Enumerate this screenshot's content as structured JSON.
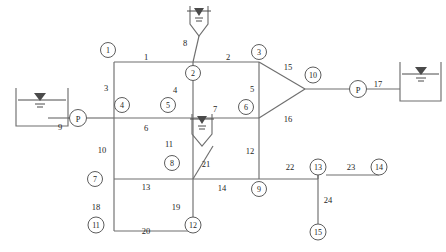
{
  "diagram": {
    "type": "hydraulic-network",
    "colors": {
      "line": "#6f6f6f",
      "text": "#1d1d1d",
      "node_fill": "#ffffff",
      "node_stroke": "#5d5d5d",
      "background": "#ffffff"
    },
    "junctions": [
      {
        "id": "1",
        "label": "1",
        "x": 108,
        "y": 50
      },
      {
        "id": "2",
        "label": "2",
        "x": 193,
        "y": 73
      },
      {
        "id": "3",
        "label": "3",
        "x": 259,
        "y": 52
      },
      {
        "id": "4",
        "label": "4",
        "x": 122,
        "y": 105
      },
      {
        "id": "5",
        "label": "5",
        "x": 168,
        "y": 105
      },
      {
        "id": "6",
        "label": "6",
        "x": 246,
        "y": 107
      },
      {
        "id": "7",
        "label": "7",
        "x": 95,
        "y": 179
      },
      {
        "id": "8",
        "label": "8",
        "x": 172,
        "y": 163
      },
      {
        "id": "9",
        "label": "9",
        "x": 259,
        "y": 189
      },
      {
        "id": "10",
        "label": "10",
        "x": 313,
        "y": 75
      },
      {
        "id": "11",
        "label": "11",
        "x": 96,
        "y": 225
      },
      {
        "id": "12",
        "label": "12",
        "x": 193,
        "y": 225
      },
      {
        "id": "13",
        "label": "13",
        "x": 318,
        "y": 167
      },
      {
        "id": "14",
        "label": "14",
        "x": 379,
        "y": 167
      },
      {
        "id": "15",
        "label": "15",
        "x": 318,
        "y": 232
      }
    ],
    "pumps": [
      {
        "id": "pump-left",
        "label": "P",
        "x": 78,
        "y": 118
      },
      {
        "id": "pump-right",
        "label": "P",
        "x": 358,
        "y": 89
      }
    ],
    "reservoirs": [
      {
        "id": "reservoir-left",
        "shape": "tank",
        "x": 16,
        "y": 88
      },
      {
        "id": "reservoir-top",
        "shape": "funnel",
        "x": 190,
        "y": 4
      },
      {
        "id": "reservoir-mid",
        "shape": "funnel",
        "x": 192,
        "y": 112
      },
      {
        "id": "reservoir-right",
        "shape": "tank",
        "x": 400,
        "y": 62
      }
    ],
    "pipe_labels": [
      {
        "id": "1",
        "label": "1",
        "x": 146,
        "y": 57
      },
      {
        "id": "2",
        "label": "2",
        "x": 228,
        "y": 57
      },
      {
        "id": "3",
        "label": "3",
        "x": 106,
        "y": 88
      },
      {
        "id": "4",
        "label": "4",
        "x": 175,
        "y": 90
      },
      {
        "id": "5",
        "label": "5",
        "x": 252,
        "y": 89
      },
      {
        "id": "6",
        "label": "6",
        "x": 146,
        "y": 128
      },
      {
        "id": "7",
        "label": "7",
        "x": 215,
        "y": 109
      },
      {
        "id": "8",
        "label": "8",
        "x": 185,
        "y": 43
      },
      {
        "id": "9",
        "label": "9",
        "x": 60,
        "y": 127
      },
      {
        "id": "10",
        "label": "10",
        "x": 102,
        "y": 150
      },
      {
        "id": "11",
        "label": "11",
        "x": 169,
        "y": 144
      },
      {
        "id": "12",
        "label": "12",
        "x": 250,
        "y": 151
      },
      {
        "id": "13",
        "label": "13",
        "x": 146,
        "y": 187
      },
      {
        "id": "14",
        "label": "14",
        "x": 222,
        "y": 188
      },
      {
        "id": "15",
        "label": "15",
        "x": 288,
        "y": 67
      },
      {
        "id": "16",
        "label": "16",
        "x": 288,
        "y": 119
      },
      {
        "id": "17",
        "label": "17",
        "x": 378,
        "y": 84
      },
      {
        "id": "18",
        "label": "18",
        "x": 96,
        "y": 207
      },
      {
        "id": "19",
        "label": "19",
        "x": 176,
        "y": 207
      },
      {
        "id": "20",
        "label": "20",
        "x": 146,
        "y": 231
      },
      {
        "id": "21",
        "label": "21",
        "x": 206,
        "y": 164
      },
      {
        "id": "22",
        "label": "22",
        "x": 290,
        "y": 167
      },
      {
        "id": "23",
        "label": "23",
        "x": 351,
        "y": 167
      },
      {
        "id": "24",
        "label": "24",
        "x": 328,
        "y": 200
      }
    ]
  }
}
